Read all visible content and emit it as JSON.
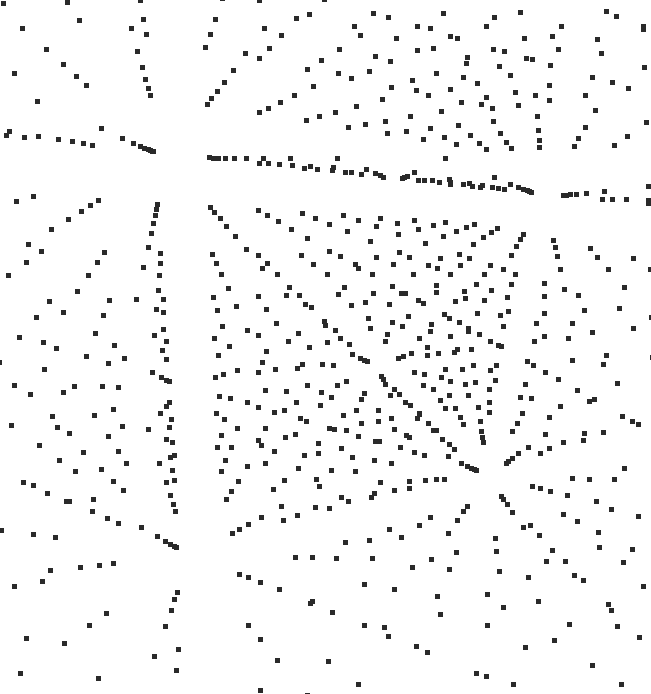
{
  "image": {
    "description": "Perspective view of a 3D cubic lattice of points seen from near its center; point rows radiate outward from a vanishing region",
    "width": 651,
    "height": 694,
    "background": "#ffffff",
    "point_color": "#2a2a2a",
    "point_size": 5
  },
  "lattice": {
    "grid_count": 11,
    "spacing": 1.0,
    "center_screen": [
      392,
      322
    ],
    "camera_distance": 6.2,
    "focal_length": 430,
    "rotation_deg": {
      "x": 18,
      "y": -28,
      "z": 6
    },
    "near_clip": 0.35
  }
}
